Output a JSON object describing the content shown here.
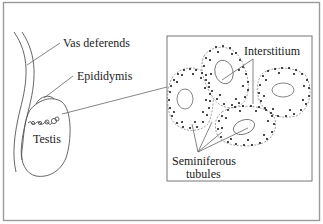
{
  "diagram": {
    "labels": {
      "vas_deferens": "Vas deferends",
      "epididymis": "Epididymis",
      "testis": "Testis",
      "interstitium": "Interstitium",
      "seminiferous_line1": "Seminiferous",
      "seminiferous_line2": "tubules"
    },
    "colors": {
      "outline": "#555555",
      "frame": "#9a9a9a",
      "dots": "#111111",
      "background": "#ffffff"
    }
  }
}
